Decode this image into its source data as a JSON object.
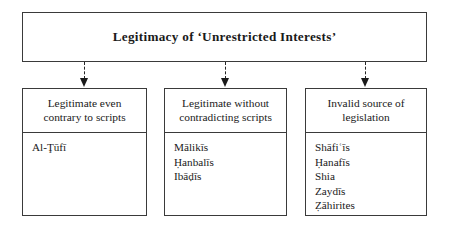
{
  "diagram": {
    "title": "Legitimacy of ‘Unrestricted Interests’",
    "nodes": [
      {
        "header": "Legitimate even contrary to scripts",
        "header_line1": "Legitimate even",
        "header_line2": "contrary to scripts",
        "items": [
          "Al-Ţūfī"
        ]
      },
      {
        "header": "Legitimate without contradicting scripts",
        "header_line1": "Legitimate without",
        "header_line2": "contradicting scripts",
        "items": [
          "Mālikīs",
          "Ḥanbalīs",
          "Ibāḍīs"
        ]
      },
      {
        "header": "Invalid source of legislation",
        "header_line1": "Invalid source of",
        "header_line2": "legislation",
        "items": [
          "Shāfiʿīs",
          "Ḥanafīs",
          "Shia",
          "Zaydīs",
          "Ẓāhirites"
        ]
      }
    ],
    "connector_style": "dashed-arrow-down"
  }
}
